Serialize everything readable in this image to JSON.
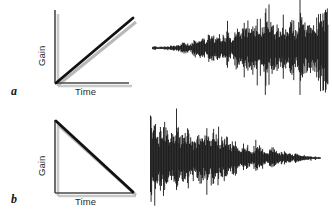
{
  "figure": {
    "background_color": "#ffffff",
    "ink_color": "#101010",
    "axis_color": "#4a4a4a",
    "shadow_color": "#c9c9c9"
  },
  "panels": [
    {
      "letter": "a",
      "name": "fade-in-panel",
      "ylabel": "Gain",
      "xlabel": "Time",
      "envelope": "increasing",
      "waveform": "crescendo"
    },
    {
      "letter": "b",
      "name": "fade-out-panel",
      "ylabel": "Gain",
      "xlabel": "Time",
      "envelope": "decreasing",
      "waveform": "decrescendo"
    }
  ],
  "chart_data": {
    "type": "line",
    "title": "",
    "xlabel": "Time",
    "ylabel": "Gain",
    "xlim": [
      0,
      1
    ],
    "ylim": [
      0,
      1
    ],
    "grid": false,
    "legend": "none",
    "series": [
      {
        "name": "a: fade-in gain ramp",
        "panel": "a",
        "x": [
          0,
          1
        ],
        "values": [
          0,
          1
        ]
      },
      {
        "name": "b: fade-out gain ramp",
        "panel": "b",
        "x": [
          0,
          1
        ],
        "values": [
          1,
          0
        ]
      }
    ],
    "waveforms": [
      {
        "name": "a: amplitude envelope (crescendo)",
        "panel": "a",
        "x": [
          0.0,
          0.1,
          0.2,
          0.3,
          0.4,
          0.5,
          0.6,
          0.7,
          0.8,
          0.9,
          1.0
        ],
        "envelope": [
          0.03,
          0.08,
          0.16,
          0.26,
          0.36,
          0.46,
          0.58,
          0.68,
          0.8,
          0.92,
          1.0
        ]
      },
      {
        "name": "b: amplitude envelope (decrescendo)",
        "panel": "b",
        "x": [
          0.0,
          0.1,
          0.2,
          0.3,
          0.4,
          0.5,
          0.6,
          0.7,
          0.8,
          0.9,
          1.0
        ],
        "envelope": [
          1.0,
          0.92,
          0.8,
          0.68,
          0.56,
          0.44,
          0.33,
          0.23,
          0.14,
          0.07,
          0.02
        ]
      }
    ]
  }
}
